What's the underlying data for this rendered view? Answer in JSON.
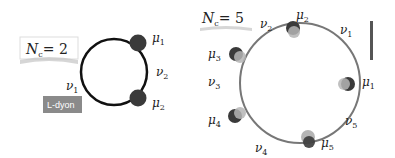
{
  "left_panel": {
    "nc_label": "N",
    "nc_sub": "c",
    "nc_value": "= 2",
    "tag": "L-dyon",
    "mu": [
      {
        "sym": "μ",
        "sub": "1"
      },
      {
        "sym": "μ",
        "sub": "2"
      }
    ],
    "nu": [
      {
        "sym": "ν",
        "sub": "1"
      },
      {
        "sym": "ν",
        "sub": "2"
      }
    ]
  },
  "right_panel": {
    "nc_label": "N",
    "nc_sub": "c",
    "nc_value": "= 5",
    "mu": [
      {
        "sym": "μ",
        "sub": "1"
      },
      {
        "sym": "μ",
        "sub": "2"
      },
      {
        "sym": "μ",
        "sub": "3"
      },
      {
        "sym": "μ",
        "sub": "4"
      },
      {
        "sym": "μ",
        "sub": "5"
      }
    ],
    "nu": [
      {
        "sym": "ν",
        "sub": "1"
      },
      {
        "sym": "ν",
        "sub": "2"
      },
      {
        "sym": "ν",
        "sub": "3"
      },
      {
        "sym": "ν",
        "sub": "4"
      },
      {
        "sym": "ν",
        "sub": "5"
      }
    ]
  },
  "colors": {
    "dark_dot": "#3a3a3a",
    "light_dot": "#b5b5b5",
    "circle_left": "#111111",
    "circle_right": "#777777",
    "tag_bg": "#8a8a8a"
  }
}
